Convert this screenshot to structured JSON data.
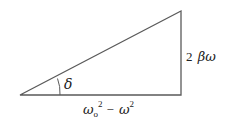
{
  "diagram": {
    "type": "right-triangle",
    "vertices": {
      "left": [
        20,
        95
      ],
      "right_bottom": [
        181,
        95
      ],
      "top": [
        181,
        11
      ]
    },
    "angle_label": "δ",
    "vertical_side": {
      "coefficient": "2",
      "symbol": "βω"
    },
    "horizontal_side": {
      "term1": "ω",
      "term1_subscript": "o",
      "term1_superscript": "2",
      "operator": "−",
      "term2": "ω",
      "term2_superscript": "2"
    },
    "colors": {
      "line": "#555555",
      "text": "#222222"
    }
  }
}
